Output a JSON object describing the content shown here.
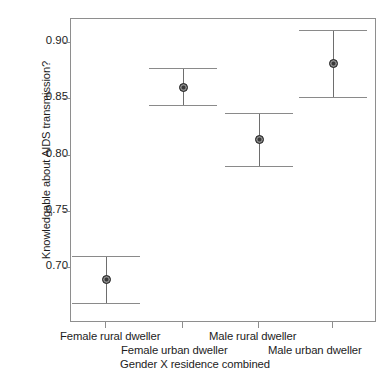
{
  "chart_data": {
    "type": "scatter",
    "title": "",
    "xlabel": "Gender X residence combined",
    "ylabel": "Knowledgable about AIDS transmission?",
    "categories": [
      "Female rural dweller",
      "Female urban dweller",
      "Male rural dweller",
      "Male urban dweller"
    ],
    "values": [
      0.69,
      0.861,
      0.815,
      0.882
    ],
    "error_upper": [
      0.711,
      0.878,
      0.838,
      0.912
    ],
    "error_lower": [
      0.669,
      0.845,
      0.791,
      0.852
    ],
    "ylim": [
      0.662,
      0.932
    ],
    "yticks": [
      0.9,
      0.85,
      0.8,
      0.75,
      0.7
    ],
    "ytick_labels": [
      "0.90",
      "0.85",
      "0.80",
      "0.75",
      "0.70"
    ],
    "grid": false,
    "legend": "none",
    "series": [
      {
        "name": "Mean with 95% CI",
        "points": [
          {
            "category": "Female rural dweller",
            "value": 0.69,
            "ci_low": 0.669,
            "ci_high": 0.711
          },
          {
            "category": "Female urban dweller",
            "value": 0.861,
            "ci_low": 0.845,
            "ci_high": 0.878
          },
          {
            "category": "Male rural dweller",
            "value": 0.815,
            "ci_low": 0.791,
            "ci_high": 0.838
          },
          {
            "category": "Male urban dweller",
            "value": 0.882,
            "ci_low": 0.852,
            "ci_high": 0.912
          }
        ]
      }
    ]
  },
  "colors": {
    "marker": "#3a3a3a",
    "errorbar": "#8a8a8a",
    "frame": "#8e8e8e",
    "text": "#1c1c1c",
    "background": "#ffffff"
  }
}
